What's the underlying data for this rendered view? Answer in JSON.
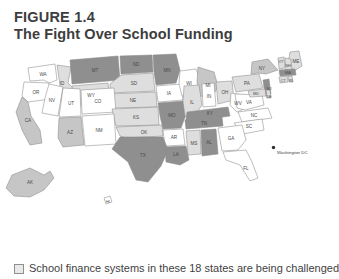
{
  "figure": {
    "number": "FIGURE 1.4",
    "title": "The Fight Over School Funding"
  },
  "legend": {
    "swatch_icon": "legend-swatch-box",
    "text": "School finance systems in these 18 states are being challenged"
  },
  "map": {
    "dc_label": "Washington DC",
    "dc_marker_icon": "dc-dot-marker"
  },
  "chart_data": {
    "type": "map",
    "title": "The Fight Over School Funding",
    "subtitle": "FIGURE 1.4",
    "legend_entries": [
      {
        "label": "School finance systems in these 18 states are being challenged",
        "color": "#8f8f8f"
      }
    ],
    "shades": {
      "challenged": "#8f8f8f",
      "medium": "#c6c6c6",
      "light": "#dedede",
      "white": "#ffffff"
    },
    "regions": [
      {
        "code": "WA",
        "shade": "white"
      },
      {
        "code": "OR",
        "shade": "white"
      },
      {
        "code": "ID",
        "shade": "light"
      },
      {
        "code": "MT",
        "shade": "challenged"
      },
      {
        "code": "ND",
        "shade": "challenged"
      },
      {
        "code": "MN",
        "shade": "challenged"
      },
      {
        "code": "WY",
        "shade": "light"
      },
      {
        "code": "SD",
        "shade": "light"
      },
      {
        "code": "NE",
        "shade": "light"
      },
      {
        "code": "IA",
        "shade": "white"
      },
      {
        "code": "WI",
        "shade": "white"
      },
      {
        "code": "MI",
        "shade": "medium"
      },
      {
        "code": "NV",
        "shade": "white"
      },
      {
        "code": "UT",
        "shade": "white"
      },
      {
        "code": "CO",
        "shade": "white"
      },
      {
        "code": "KS",
        "shade": "light"
      },
      {
        "code": "MO",
        "shade": "challenged"
      },
      {
        "code": "IL",
        "shade": "light"
      },
      {
        "code": "IN",
        "shade": "white"
      },
      {
        "code": "OH",
        "shade": "light"
      },
      {
        "code": "CA",
        "shade": "medium"
      },
      {
        "code": "AZ",
        "shade": "medium"
      },
      {
        "code": "NM",
        "shade": "white"
      },
      {
        "code": "OK",
        "shade": "light"
      },
      {
        "code": "AR",
        "shade": "white"
      },
      {
        "code": "KY",
        "shade": "challenged"
      },
      {
        "code": "TN",
        "shade": "challenged"
      },
      {
        "code": "WV",
        "shade": "white"
      },
      {
        "code": "VA",
        "shade": "white"
      },
      {
        "code": "NC",
        "shade": "white"
      },
      {
        "code": "SC",
        "shade": "white"
      },
      {
        "code": "GA",
        "shade": "white"
      },
      {
        "code": "FL",
        "shade": "white"
      },
      {
        "code": "AL",
        "shade": "challenged"
      },
      {
        "code": "MS",
        "shade": "light"
      },
      {
        "code": "LA",
        "shade": "challenged"
      },
      {
        "code": "TX",
        "shade": "challenged"
      },
      {
        "code": "PA",
        "shade": "light"
      },
      {
        "code": "NY",
        "shade": "medium"
      },
      {
        "code": "ME",
        "shade": "light"
      },
      {
        "code": "VT",
        "shade": "light"
      },
      {
        "code": "NH",
        "shade": "light"
      },
      {
        "code": "MA",
        "shade": "challenged"
      },
      {
        "code": "CT",
        "shade": "light"
      },
      {
        "code": "RI",
        "shade": "light"
      },
      {
        "code": "NJ",
        "shade": "challenged"
      },
      {
        "code": "MD",
        "shade": "light"
      },
      {
        "code": "DE",
        "shade": "light"
      },
      {
        "code": "AK",
        "shade": "medium"
      },
      {
        "code": "HI",
        "shade": "white"
      }
    ]
  }
}
